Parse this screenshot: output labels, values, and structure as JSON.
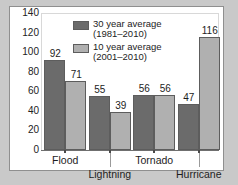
{
  "chart_data": {
    "type": "bar",
    "title": "",
    "xlabel": "",
    "ylabel": "",
    "categories": [
      "Flood",
      "Lightning",
      "Tornado",
      "Hurricane"
    ],
    "series": [
      {
        "name": "30 year average (1981–2010)",
        "legend_line1": "30 year average",
        "legend_line2": "(1981–2010)",
        "color": "#6b6b6b",
        "values": [
          92,
          55,
          56,
          47
        ]
      },
      {
        "name": "10 year average (2001–2010)",
        "legend_line1": "10 year average",
        "legend_line2": "(2001–2010)",
        "color": "#b0b0b0",
        "values": [
          71,
          39,
          56,
          116
        ]
      }
    ],
    "ylim": [
      0,
      140
    ],
    "yticks": [
      0,
      20,
      40,
      60,
      80,
      100,
      120,
      140
    ],
    "ytick_labels": [
      "0",
      "20",
      "40",
      "60",
      "80",
      "100",
      "120",
      "140"
    ],
    "grid": false,
    "legend_position": "top-center",
    "data_labels": true,
    "data_label_values": [
      [
        "92",
        "71"
      ],
      [
        "55",
        "39"
      ],
      [
        "56",
        "56"
      ],
      [
        "47",
        "116"
      ]
    ],
    "category_label_rows": [
      0,
      1,
      0,
      1
    ]
  },
  "colors": {
    "page_background": "#c9c9c9",
    "panel_background": "#ffffff",
    "panel_border": "#8f8f8f",
    "axis": "#6f6f6f",
    "text": "#1d1d1d",
    "series_dark": "#6b6b6b",
    "series_light": "#b0b0b0",
    "bar_outline": "#5d5d5d"
  }
}
